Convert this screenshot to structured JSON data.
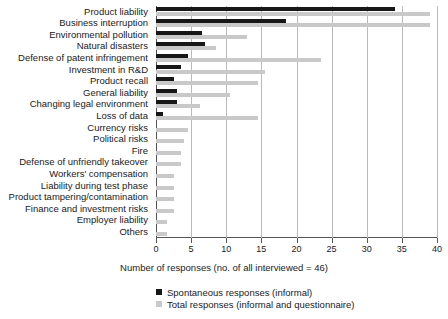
{
  "chart_data": {
    "type": "bar",
    "orientation": "horizontal",
    "title": "",
    "xlabel": "Number of responses (no. of all interviewed = 46)",
    "ylabel": "",
    "xlim": [
      0,
      40
    ],
    "xticks": [
      0,
      5,
      10,
      15,
      20,
      25,
      30,
      35,
      40
    ],
    "grid": true,
    "legend_position": "bottom-left",
    "categories": [
      "Product liability",
      "Business interruption",
      "Environmental pollution",
      "Natural disasters",
      "Defense of patent infringement",
      "Investment in R&D",
      "Product recall",
      "General liability",
      "Changing legal environment",
      "Loss of data",
      "Currency risks",
      "Political risks",
      "Fire",
      "Defense of unfriendly takeover",
      "Workers' compensation",
      "Liability during test phase",
      "Product tampering/contamination",
      "Finance and investment risks",
      "Employer liability",
      "Others"
    ],
    "series": [
      {
        "name": "Spontaneous responses (informal)",
        "color": "#171717",
        "values": [
          34,
          18.5,
          6.5,
          7,
          4.5,
          3.5,
          2.5,
          3,
          3,
          1,
          0,
          0,
          0,
          0,
          0,
          0,
          0,
          0,
          0,
          0
        ]
      },
      {
        "name": "Total responses (informal and questionnaire)",
        "color": "#c9c9c9",
        "values": [
          39,
          39,
          13,
          8.5,
          23.5,
          15.5,
          14.5,
          10.5,
          6.3,
          14.5,
          4.5,
          4,
          3.5,
          3.5,
          2.5,
          2.5,
          2.5,
          2.5,
          1.5,
          1.5
        ]
      }
    ]
  },
  "legend": {
    "items": [
      {
        "label": "Spontaneous responses (informal)",
        "color": "#171717"
      },
      {
        "label": "Total responses (informal and questionnaire)",
        "color": "#c9c9c9"
      }
    ]
  }
}
